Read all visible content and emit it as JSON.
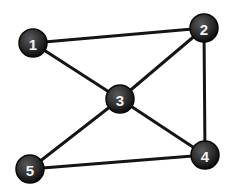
{
  "diagram": {
    "type": "undirected-graph",
    "node_color": "#2e2e2e",
    "edge_color": "#141414",
    "label_color": "#f2f2f2",
    "nodes": [
      {
        "id": "1",
        "label": "1",
        "x": 33,
        "y": 43
      },
      {
        "id": "2",
        "label": "2",
        "x": 204,
        "y": 28
      },
      {
        "id": "3",
        "label": "3",
        "x": 120,
        "y": 99
      },
      {
        "id": "4",
        "label": "4",
        "x": 205,
        "y": 155
      },
      {
        "id": "5",
        "label": "5",
        "x": 30,
        "y": 169
      }
    ],
    "edges": [
      {
        "from": "1",
        "to": "2"
      },
      {
        "from": "1",
        "to": "3"
      },
      {
        "from": "2",
        "to": "3"
      },
      {
        "from": "2",
        "to": "4"
      },
      {
        "from": "3",
        "to": "4"
      },
      {
        "from": "3",
        "to": "5"
      },
      {
        "from": "5",
        "to": "4"
      }
    ]
  }
}
